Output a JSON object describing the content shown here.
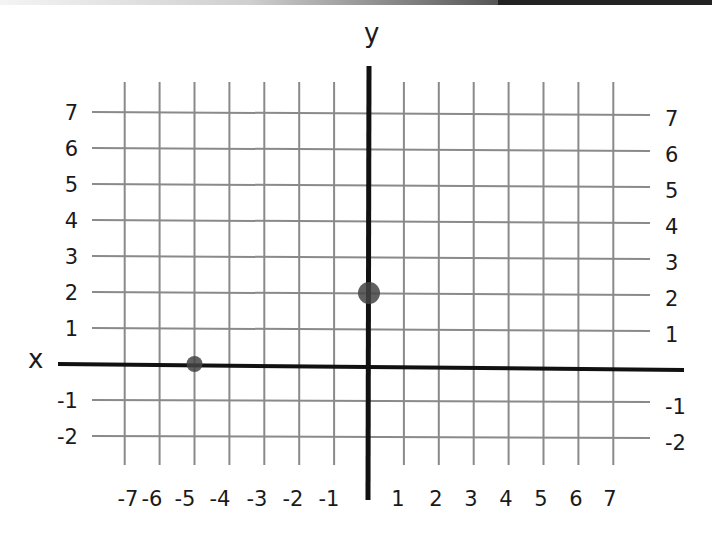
{
  "chart_data": {
    "type": "scatter",
    "title": "",
    "xlabel": "x",
    "ylabel": "y",
    "xlim": [
      -7,
      7
    ],
    "ylim": [
      -2,
      7
    ],
    "grid": true,
    "x_ticks": [
      "-7",
      "-6",
      "-5",
      "-4",
      "-3",
      "-2",
      "-1",
      "1",
      "2",
      "3",
      "4",
      "5",
      "6",
      "7"
    ],
    "y_ticks_left": [
      "7",
      "6",
      "5",
      "4",
      "3",
      "2",
      "1",
      "-1",
      "-2"
    ],
    "y_ticks_right": [
      "7",
      "6",
      "5",
      "4",
      "3",
      "2",
      "1",
      "-1",
      "-2"
    ],
    "points": [
      {
        "x": 0,
        "y": 2
      },
      {
        "x": -5,
        "y": 0
      }
    ]
  },
  "colors": {
    "axis": "#111111",
    "grid": "#8a8a8a",
    "point": "#444444",
    "text": "#1a1a1a"
  }
}
